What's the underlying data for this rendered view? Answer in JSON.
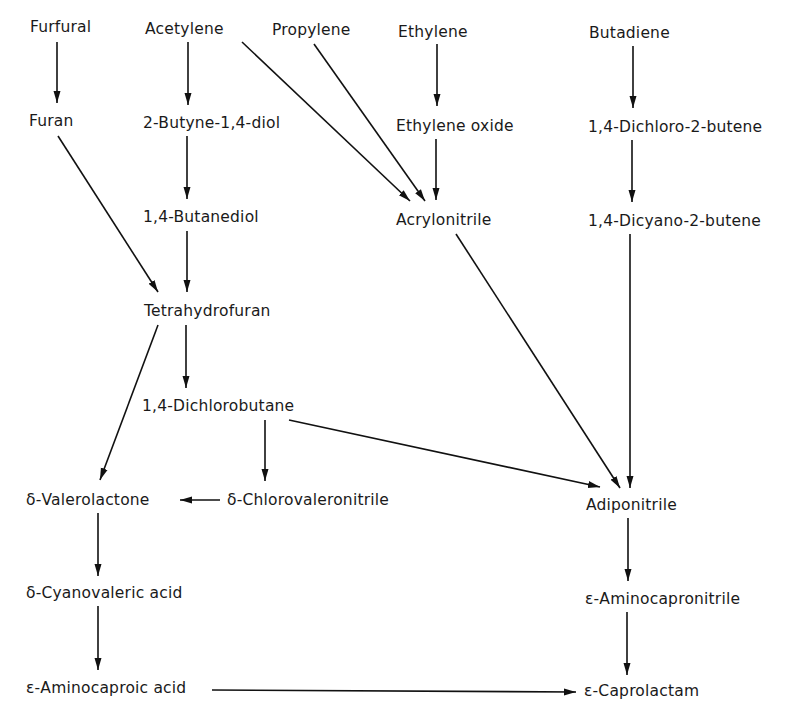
{
  "diagram": {
    "type": "chemical synthesis pathway flowchart",
    "target": "ε-Caprolactam",
    "nodes": {
      "furfural": "Furfural",
      "acetylene": "Acetylene",
      "propylene": "Propylene",
      "ethylene": "Ethylene",
      "butadiene": "Butadiene",
      "furan": "Furan",
      "butynediol": "2-Butyne-1,4-diol",
      "ethylene_oxide": "Ethylene oxide",
      "dichlorobutene": "1,4-Dichloro-2-butene",
      "butanediol": "1,4-Butanediol",
      "acrylonitrile": "Acrylonitrile",
      "dicyanobutene": "1,4-Dicyano-2-butene",
      "thf": "Tetrahydrofuran",
      "dichlorobutane": "1,4-Dichlorobutane",
      "valerolactone": "δ-Valerolactone",
      "chlorovaleronitrile": "δ-Chlorovaleronitrile",
      "adiponitrile": "Adiponitrile",
      "cyanovaleric_acid": "δ-Cyanovaleric acid",
      "aminocapronitrile": "ε-Aminocapronitrile",
      "aminocaproic_acid": "ε-Aminocaproic acid",
      "caprolactam": "ε-Caprolactam"
    },
    "edges": [
      {
        "from": "Furfural",
        "to": "Furan"
      },
      {
        "from": "Acetylene",
        "to": "2-Butyne-1,4-diol"
      },
      {
        "from": "Acetylene",
        "to": "Acrylonitrile"
      },
      {
        "from": "Propylene",
        "to": "Acrylonitrile"
      },
      {
        "from": "Ethylene",
        "to": "Ethylene oxide"
      },
      {
        "from": "Ethylene oxide",
        "to": "Acrylonitrile"
      },
      {
        "from": "Butadiene",
        "to": "1,4-Dichloro-2-butene"
      },
      {
        "from": "1,4-Dichloro-2-butene",
        "to": "1,4-Dicyano-2-butene"
      },
      {
        "from": "2-Butyne-1,4-diol",
        "to": "1,4-Butanediol"
      },
      {
        "from": "1,4-Butanediol",
        "to": "Tetrahydrofuran"
      },
      {
        "from": "Furan",
        "to": "Tetrahydrofuran"
      },
      {
        "from": "Tetrahydrofuran",
        "to": "1,4-Dichlorobutane"
      },
      {
        "from": "Tetrahydrofuran",
        "to": "δ-Valerolactone"
      },
      {
        "from": "1,4-Dichlorobutane",
        "to": "δ-Chlorovaleronitrile"
      },
      {
        "from": "1,4-Dichlorobutane",
        "to": "Adiponitrile"
      },
      {
        "from": "Acrylonitrile",
        "to": "Adiponitrile"
      },
      {
        "from": "1,4-Dicyano-2-butene",
        "to": "Adiponitrile"
      },
      {
        "from": "δ-Chlorovaleronitrile",
        "to": "δ-Valerolactone"
      },
      {
        "from": "δ-Valerolactone",
        "to": "δ-Cyanovaleric acid"
      },
      {
        "from": "δ-Cyanovaleric acid",
        "to": "ε-Aminocaproic acid"
      },
      {
        "from": "ε-Aminocaproic acid",
        "to": "ε-Caprolactam"
      },
      {
        "from": "Adiponitrile",
        "to": "ε-Aminocapronitrile"
      },
      {
        "from": "ε-Aminocapronitrile",
        "to": "ε-Caprolactam"
      }
    ]
  }
}
